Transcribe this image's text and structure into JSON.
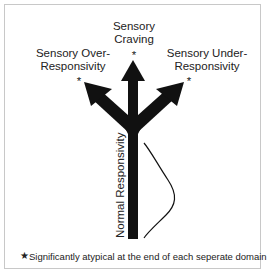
{
  "diagram": {
    "labels": {
      "craving": [
        "Sensory",
        "Craving"
      ],
      "over": [
        "Sensory Over-",
        "Responsivity"
      ],
      "under": [
        "Sensory Under-",
        "Responsivity"
      ],
      "normal": "Normal Responsivity"
    },
    "marker": "*",
    "footnote": {
      "symbol": "★",
      "text": "Significantly atypical at the end of each seperate domain"
    },
    "colors": {
      "arrow": "#111111",
      "border": "#c8c8c8",
      "text": "#222222"
    }
  }
}
